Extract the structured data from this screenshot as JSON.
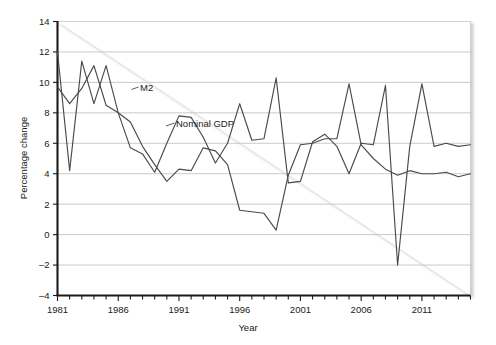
{
  "chart_data": {
    "type": "line",
    "title": "",
    "xlabel": "Year",
    "ylabel": "Percentage change",
    "xlim": [
      1981,
      2015
    ],
    "ylim": [
      -4,
      14
    ],
    "yticks": [
      -4,
      -2,
      0,
      2,
      4,
      6,
      8,
      10,
      12,
      14
    ],
    "ytick_labels": [
      "-4",
      "-2",
      "0",
      "2",
      "4",
      "6",
      "8",
      "10",
      "12",
      "14"
    ],
    "xticks": [
      1981,
      1986,
      1991,
      1996,
      2001,
      2006,
      2011
    ],
    "xtick_labels": [
      "1981",
      "1986",
      "1991",
      "1996",
      "2001",
      "2006",
      "2011"
    ],
    "minor_xtick_interval": 1,
    "grid": "horizontal",
    "legend": "inline-annotations",
    "x": [
      1981,
      1982,
      1983,
      1984,
      1985,
      1986,
      1987,
      1988,
      1989,
      1990,
      1991,
      1992,
      1993,
      1994,
      1995,
      1996,
      1997,
      1998,
      1999,
      2000,
      2001,
      2002,
      2003,
      2004,
      2005,
      2006,
      2007,
      2008,
      2009,
      2010,
      2011,
      2012,
      2013,
      2014,
      2015
    ],
    "series": [
      {
        "name": "M2",
        "label": "M2",
        "values": [
          12.0,
          4.2,
          11.4,
          8.6,
          11.1,
          8.0,
          5.7,
          5.3,
          4.1,
          6.0,
          7.8,
          7.7,
          6.4,
          4.7,
          6.0,
          8.6,
          6.2,
          6.3,
          10.3,
          3.4,
          3.5,
          6.1,
          6.6,
          5.8,
          4.0,
          6.0,
          5.9,
          9.8,
          -2.0,
          5.8,
          9.9,
          5.8,
          6.0,
          5.8,
          5.9
        ]
      },
      {
        "name": "Nominal GDP",
        "label": "Nominal GDP",
        "values": [
          9.7,
          8.6,
          9.6,
          11.1,
          8.5,
          8.0,
          7.4,
          5.8,
          4.6,
          3.5,
          4.3,
          4.2,
          5.7,
          5.5,
          4.6,
          1.6,
          1.5,
          1.4,
          0.3,
          3.9,
          5.9,
          6.0,
          6.3,
          6.3,
          9.9,
          5.9,
          5.0,
          4.3,
          3.9,
          4.2,
          4.0,
          4.0,
          4.1,
          3.8,
          4.0
        ]
      }
    ],
    "annotations": [
      {
        "text": "M2",
        "x_pos": 1986.0,
        "y_pos": 9.35
      },
      {
        "text": "Nominal GDP",
        "x_pos": 1991.8,
        "y_pos": 7.0
      }
    ]
  },
  "axis": {
    "y_title": "Percentage change",
    "x_title": "Year"
  },
  "colors": {
    "line": "#4a4a4a",
    "axis": "#1a1a1a",
    "grid": "#b9bcc0",
    "background": "#ffffff"
  }
}
